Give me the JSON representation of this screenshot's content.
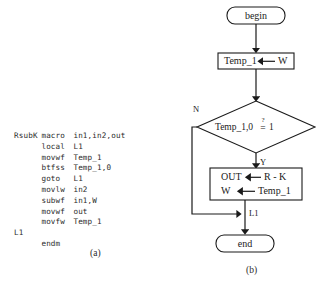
{
  "figure": {
    "panel_a": {
      "caption": "(a)",
      "title": "RsubK macro assembly listing",
      "code_lines": [
        {
          "label": "RsubK",
          "op": "macro",
          "arg": "in1,in2,out"
        },
        {
          "label": "",
          "op": "local",
          "arg": "L1"
        },
        {
          "label": "",
          "op": "movwf",
          "arg": "Temp_1"
        },
        {
          "label": "",
          "op": "btfss",
          "arg": "Temp_1,0"
        },
        {
          "label": "",
          "op": "goto",
          "arg": "L1"
        },
        {
          "label": "",
          "op": "movlw",
          "arg": "in2"
        },
        {
          "label": "",
          "op": "subwf",
          "arg": "in1,W"
        },
        {
          "label": "",
          "op": "movwf",
          "arg": "out"
        },
        {
          "label": "",
          "op": "movfw",
          "arg": "Temp_1"
        },
        {
          "label": "L1",
          "op": "",
          "arg": ""
        },
        {
          "label": "",
          "op": "endm",
          "arg": ""
        }
      ]
    },
    "panel_b": {
      "caption": "(b)",
      "title": "RsubK macro flowchart",
      "nodes": {
        "begin": "begin",
        "assign_temp": "Temp_1",
        "assign_temp_src": "W",
        "decision": "Temp_1,0 = 1",
        "decision_lhs": "Temp_1,0",
        "decision_op": "=",
        "decision_qmark": "?",
        "decision_rhs": "1",
        "proc_line1_lhs": "OUT",
        "proc_line1_rhs": "R - K",
        "proc_line2_lhs": "W",
        "proc_line2_rhs": "Temp_1",
        "end": "end"
      },
      "edge_labels": {
        "no_branch": "N",
        "yes_branch": "Y",
        "join_label": "L1"
      }
    }
  },
  "colors": {
    "ink": "#1a1a1a",
    "code_ink": "#2b2b2b",
    "paper": "#ffffff"
  }
}
